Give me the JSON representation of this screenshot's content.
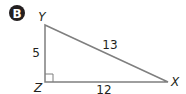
{
  "badge": {
    "label": "B",
    "color": "#231f20"
  },
  "triangle": {
    "vertices": {
      "top": "Y",
      "corner": "Z",
      "right": "X"
    },
    "sides": {
      "YZ": "5",
      "XY": "13",
      "ZX": "12"
    },
    "right_angle_at": "Z",
    "stroke_color": "#7f7f7f"
  }
}
